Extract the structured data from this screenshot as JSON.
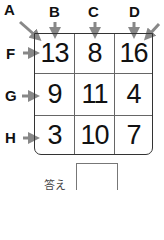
{
  "puzzle": {
    "column_labels": [
      "A",
      "B",
      "C",
      "D"
    ],
    "row_labels": [
      "F",
      "G",
      "H"
    ],
    "grid": [
      [
        13,
        8,
        16
      ],
      [
        9,
        11,
        4
      ],
      [
        3,
        10,
        7
      ]
    ],
    "answer_label": "答え",
    "answer_value": ""
  },
  "colors": {
    "arrow": "#888888",
    "border": "#333333",
    "text": "#111111"
  }
}
